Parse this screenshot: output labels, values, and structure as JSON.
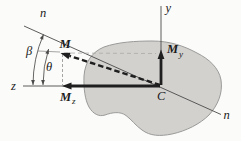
{
  "figure": {
    "colors": {
      "background": "#fbfbf9",
      "section_fill": "#d2d1ce",
      "section_edge": "#9a9a98",
      "axis": "#4a4a4a",
      "vector": "#1f1f1f",
      "construction": "#8f8e8c",
      "construction_light": "#aba9a6",
      "text": "#1a1a1a"
    },
    "labels": {
      "y_axis": "y",
      "z_axis": "z",
      "n_axis_top": "n",
      "n_axis_bottom": "n",
      "beta": "β",
      "theta": "θ",
      "moment": "M",
      "moment_y": {
        "base": "M",
        "sub": "y"
      },
      "moment_z": {
        "base": "M",
        "sub": "z"
      },
      "centroid": "C"
    }
  }
}
